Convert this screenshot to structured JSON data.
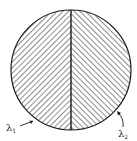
{
  "diagram": {
    "shape": "circle divided vertically into two hatched halves",
    "colors": {
      "stroke": "#1a1a1a",
      "background": "#ffffff"
    },
    "regions": [
      {
        "name": "left-half",
        "hatch": "diagonal-up-right",
        "label": "λ",
        "label_sub": "1"
      },
      {
        "name": "right-half",
        "hatch": "diagonal-down-right",
        "label": "λ",
        "label_sub": "2"
      }
    ]
  }
}
